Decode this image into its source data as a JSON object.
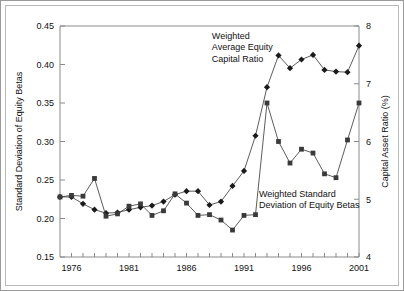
{
  "chart_data": {
    "type": "line",
    "title": "",
    "xlabel": "",
    "ylabel": "Standard Deviation of Equity Betas",
    "y2label": "Capital Asset Ratio (%)",
    "xlim": [
      1975,
      2001
    ],
    "ylim": [
      0.15,
      0.45
    ],
    "y2lim": [
      4,
      8
    ],
    "yticks": [
      "0.15",
      "0.20",
      "0.25",
      "0.30",
      "0.35",
      "0.40",
      "0.45"
    ],
    "ytick_values": [
      0.15,
      0.2,
      0.25,
      0.3,
      0.35,
      0.4,
      0.45
    ],
    "y2ticks": [
      "4",
      "5",
      "6",
      "7",
      "8"
    ],
    "y2tick_values": [
      4,
      5,
      6,
      7,
      8
    ],
    "xticks": [
      "1976",
      "1981",
      "1986",
      "1991",
      "1996",
      "2001"
    ],
    "xtick_values": [
      1976,
      1981,
      1986,
      1991,
      1996,
      2001
    ],
    "grid": false,
    "legend_position": "inline-annotations",
    "x": [
      1975,
      1976,
      1977,
      1978,
      1979,
      1980,
      1981,
      1982,
      1983,
      1984,
      1985,
      1986,
      1987,
      1988,
      1989,
      1990,
      1991,
      1992,
      1993,
      1994,
      1995,
      1996,
      1997,
      1998,
      1999,
      2000,
      2001
    ],
    "series": [
      {
        "name": "Weighted Average Equity Capital Ratio",
        "axis": "right",
        "marker": "diamond",
        "label": "Weighted\nAverage Equity\nCapital Ratio",
        "values": [
          5.04,
          5.04,
          4.92,
          4.82,
          4.76,
          4.77,
          4.82,
          4.86,
          4.89,
          4.96,
          5.08,
          5.14,
          5.14,
          4.9,
          4.96,
          5.23,
          5.49,
          6.1,
          6.94,
          7.49,
          7.27,
          7.42,
          7.5,
          7.24,
          7.21,
          7.2,
          7.66
        ]
      },
      {
        "name": "Weighted Standard Deviation of Equity Betas",
        "axis": "left",
        "marker": "square",
        "label": "Weighted Standard\nDeviation of Equity Betas",
        "values": [
          0.228,
          0.23,
          0.229,
          0.252,
          0.203,
          0.206,
          0.216,
          0.219,
          0.204,
          0.21,
          0.232,
          0.22,
          0.204,
          0.205,
          0.198,
          0.185,
          0.204,
          0.205,
          0.35,
          0.3,
          0.272,
          0.29,
          0.285,
          0.258,
          0.253,
          0.302,
          0.35
        ]
      }
    ],
    "annotations": [
      {
        "text_lines": [
          "Weighted",
          "Average Equity",
          "Capital Ratio"
        ],
        "x": 1988.2,
        "y_axis": "right",
        "y": 7.78
      },
      {
        "text_lines": [
          "Weighted Standard",
          "Deviation of Equity Betas"
        ],
        "x": 1992.3,
        "y_axis": "left",
        "y": 0.228
      }
    ]
  }
}
